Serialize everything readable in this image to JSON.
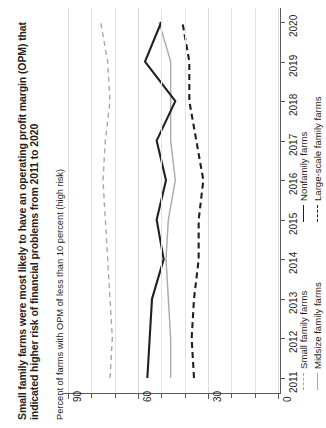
{
  "chart_data": {
    "type": "line",
    "orientation": "rotated-90",
    "title": "Small family farms were most likely to have an operating profit margin (OPM) that indicated higher risk of financial problems from 2011 to 2020",
    "subtitle": "",
    "xlabel": "",
    "ylabel": "Percent of farms with OPM of less than 10 percent (high risk)",
    "x": [
      2011,
      2012,
      2013,
      2014,
      2015,
      2016,
      2017,
      2018,
      2019,
      2020
    ],
    "tick_labels_x": [
      "2011",
      "2012",
      "2013",
      "2014",
      "2015",
      "2016",
      "2017",
      "2018",
      "2019",
      "2020"
    ],
    "ylim": [
      0,
      90
    ],
    "ytick_major": [
      0,
      30,
      60,
      90
    ],
    "ytick_minor": [
      10,
      20,
      40,
      50,
      70,
      80
    ],
    "tick_labels_y": [
      "90",
      "60",
      "30",
      "0"
    ],
    "grid": true,
    "legend_position": "bottom-right",
    "series": [
      {
        "name": "Small family farms",
        "style": "dashed",
        "color": "#a7a9ac",
        "values": [
          72,
          71,
          72,
          73,
          74,
          75,
          74,
          72,
          73,
          76
        ]
      },
      {
        "name": "Midsize family farms",
        "style": "solid",
        "color": "#a7a9ac",
        "values": [
          46,
          46,
          47,
          48,
          47,
          44,
          46,
          46,
          46,
          51
        ]
      },
      {
        "name": "Nonfamily farms",
        "style": "solid",
        "color": "#231f20",
        "values": [
          56,
          55,
          54,
          49,
          52,
          48,
          52,
          44,
          57,
          50
        ]
      },
      {
        "name": "Large-scale family farms",
        "style": "dashed",
        "color": "#231f20",
        "values": [
          36,
          37,
          36,
          34,
          34,
          32,
          35,
          38,
          38,
          41
        ]
      }
    ]
  },
  "legend": {
    "column1": [
      {
        "label": "Small family farms",
        "swatch": "dash-gray"
      },
      {
        "label": "Midsize family farms",
        "swatch": "solid-gray"
      }
    ],
    "column2": [
      {
        "label": "Nonfamily farms",
        "swatch": "solid-black"
      },
      {
        "label": "Large-scale family farms",
        "swatch": "dash-black"
      }
    ]
  }
}
